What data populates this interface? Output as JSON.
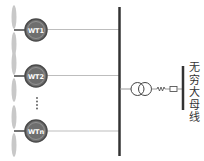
{
  "diagram": {
    "type": "single-line diagram",
    "turbines": [
      {
        "label": "WT1",
        "y": 30
      },
      {
        "label": "WT2",
        "y": 76
      },
      {
        "label": "WTn",
        "y": 131
      }
    ],
    "ellipsis": "⋮",
    "infinite_bus_label": "无穷大母线",
    "components": [
      "wind-turbine",
      "collector-bus",
      "transformer",
      "resistor",
      "inductor",
      "infinite-bus"
    ],
    "colors": {
      "hub_fill": "#6e6e6e",
      "hub_ring": "#4a4a4a",
      "blade": "#c8c8c8",
      "bus": "#333333",
      "feeder": "#bdbdbd",
      "text": "#333333"
    }
  }
}
